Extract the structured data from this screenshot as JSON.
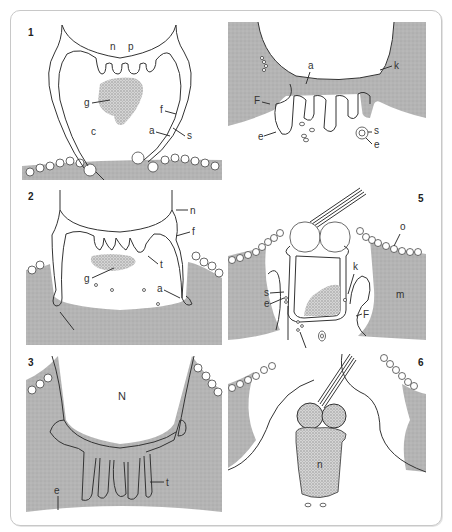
{
  "figure": {
    "type": "scientific-illustration",
    "panel_count": 6,
    "colors": {
      "tissue": "#b4b4b4",
      "granule": "#9a9a9a",
      "line": "#333333",
      "background": "#ffffff",
      "frame": "#c8c8c8"
    },
    "panels": [
      {
        "number": "1",
        "labels": {
          "n": "n",
          "p": "p",
          "g": "g",
          "c": "c",
          "f": "f",
          "a": "a",
          "s": "s"
        }
      },
      {
        "number": "2",
        "labels": {
          "n": "n",
          "f": "f",
          "t": "t",
          "g": "g",
          "a": "a"
        }
      },
      {
        "number": "3",
        "labels": {
          "N": "N",
          "t": "t",
          "e": "e"
        }
      },
      {
        "number": "4",
        "labels": {
          "a": "a",
          "k": "k",
          "F": "F",
          "e1": "e",
          "s": "s",
          "e2": "e"
        }
      },
      {
        "number": "5",
        "labels": {
          "o": "o",
          "k": "k",
          "a": "a",
          "m": "m",
          "s": "s",
          "e": "e",
          "F": "F"
        }
      },
      {
        "number": "6",
        "labels": {
          "n": "n"
        }
      }
    ]
  }
}
